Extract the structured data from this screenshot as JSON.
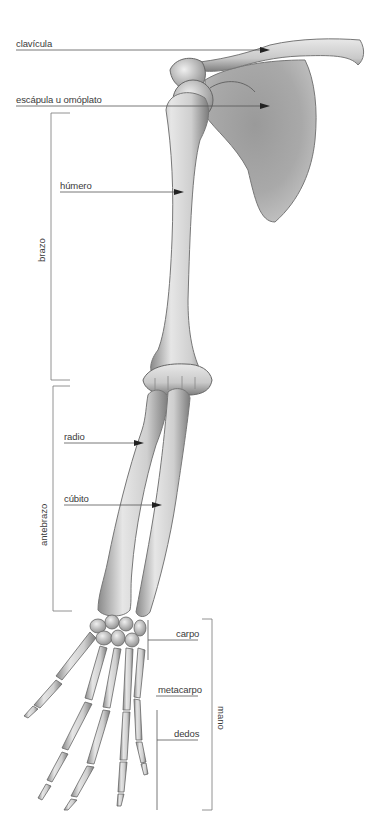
{
  "diagram": {
    "labels": {
      "clavicula": "clavícula",
      "escapula": "escápula u omóplato",
      "humero": "húmero",
      "radio": "radio",
      "cubito": "cúbito",
      "carpo": "carpo",
      "metacarpo": "metacarpo",
      "dedos": "dedos"
    },
    "groups": {
      "brazo": "brazo",
      "antebrazo": "antebrazo",
      "mano": "mano"
    },
    "colors": {
      "bone_light": "#ececec",
      "bone_mid": "#bdbdbd",
      "bone_dark": "#7a7a7a",
      "line": "#555555",
      "text": "#3a3a3a"
    }
  }
}
